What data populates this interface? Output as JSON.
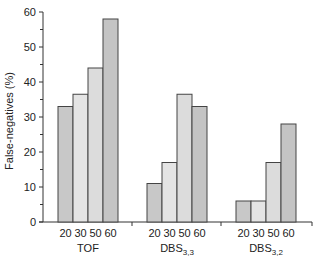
{
  "chart_data": {
    "type": "bar",
    "title": "",
    "xlabel": "",
    "ylabel": "False-negatives (%)",
    "ylim": [
      0,
      60
    ],
    "yticks": [
      0,
      10,
      20,
      30,
      40,
      50,
      60
    ],
    "grid": false,
    "legend": null,
    "groups": [
      {
        "name": "TOF",
        "sub": "",
        "categories": [
          "20",
          "30",
          "50",
          "60"
        ],
        "values": [
          33,
          36.5,
          44,
          58
        ]
      },
      {
        "name": "DBS",
        "sub": "3,3",
        "categories": [
          "20",
          "30",
          "50",
          "60"
        ],
        "values": [
          11,
          17,
          36.5,
          33
        ]
      },
      {
        "name": "DBS",
        "sub": "3,2",
        "categories": [
          "20",
          "30",
          "50",
          "60"
        ],
        "values": [
          6,
          6,
          17,
          28
        ]
      }
    ],
    "bar_colors": [
      "#c8c8c8",
      "#e4e4e4",
      "#dcdcdc",
      "#c4c4c4"
    ]
  }
}
